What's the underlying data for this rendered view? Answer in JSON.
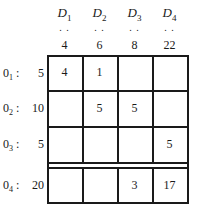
{
  "table": {
    "columns": [
      {
        "label": "D",
        "sub": "1",
        "demand": "4",
        "dots": ". ."
      },
      {
        "label": "D",
        "sub": "2",
        "demand": "6",
        "dots": ". ."
      },
      {
        "label": "D",
        "sub": "3",
        "demand": "8",
        "dots": ". ."
      },
      {
        "label": "D",
        "sub": "4",
        "demand": "22",
        "dots": ". ."
      }
    ],
    "rows": [
      {
        "label": "0",
        "sub": "1",
        "sep": ":",
        "supply": "5",
        "cells": [
          "4",
          "1",
          "",
          ""
        ]
      },
      {
        "label": "0",
        "sub": "2",
        "sep": ":",
        "supply": "10",
        "cells": [
          "",
          "5",
          "5",
          ""
        ]
      },
      {
        "label": "0",
        "sub": "3",
        "sep": ":",
        "supply": "5",
        "cells": [
          "",
          "",
          "",
          "5"
        ]
      },
      {
        "label": "0",
        "sub": "4",
        "sep": ":",
        "supply": "20",
        "cells": [
          "",
          "",
          "3",
          "17"
        ]
      }
    ]
  }
}
